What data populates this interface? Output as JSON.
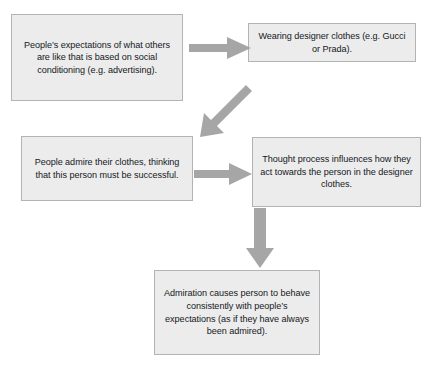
{
  "diagram": {
    "background_color": "#ffffff",
    "box_fill_color": "#ececec",
    "box_border_color": "#b3b3b3",
    "arrow_color": "#a6a6a6",
    "text_color": "#15181c",
    "boxes": [
      {
        "id": "expectations",
        "text": "People’s expectations of what others are like that is based on social conditioning (e.g. advertising)."
      },
      {
        "id": "designer",
        "text": "Wearing designer clothes (e.g. Gucci or Prada)."
      },
      {
        "id": "admire",
        "text": "People admire their clothes, thinking that this person must be successful."
      },
      {
        "id": "thought",
        "text": "Thought process influences how they act towards the person in the designer clothes."
      },
      {
        "id": "admiration",
        "text": "Admiration causes person to behave consistently with people’s expectations (as if they have always been admired)."
      }
    ],
    "arrows": [
      {
        "id": "top-right",
        "direction": "right",
        "from": "expectations",
        "to": "designer"
      },
      {
        "id": "diagonal",
        "direction": "down-left",
        "from": "designer",
        "to": "admire"
      },
      {
        "id": "middle",
        "direction": "right",
        "from": "admire",
        "to": "thought"
      },
      {
        "id": "down",
        "direction": "down",
        "from": "thought",
        "to": "admiration"
      }
    ]
  }
}
